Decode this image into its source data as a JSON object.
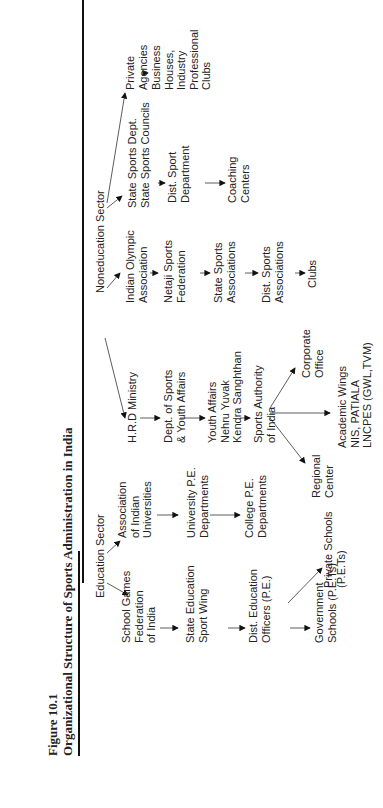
{
  "figure": {
    "number": "Figure 10.1",
    "title": "Organizational Structure of Sports Administration in India"
  },
  "sectors": {
    "education": "Education Sector",
    "noneducation": "Noneducation Sector"
  },
  "nodes": {
    "sgfi": "School Games\nFederation\nof India",
    "state_edu": "State Education\nSport Wing",
    "deo": "Dist. Education\nOfficers (P.E.)",
    "govt_schools": "Government\nSchools (P.E.Ts)",
    "private_schools": "Private Schools\n(P.E.Ts)",
    "aiu": "Association\nof Indian\nUniversities",
    "univ_pe": "University P.E.\nDepartments",
    "college_pe": "College P.E.\nDepartments",
    "hrd": "H.R.D Ministry",
    "dept_sports": "Dept. of Sports\n& Youth Affairs",
    "youth_affairs": "Youth Affairs\nNehru Yuvak\nKendra Sanghthan",
    "sai": "Sports Authority\nof India",
    "regional": "Regional\nCenter",
    "corporate": "Corporate\nOffice",
    "academic": "Academic Wings\nNIS, PATIALA\nLNCPES (GWL,TVM)",
    "ioa": "Indian Olympic\nAssociation",
    "netaji": "Netaji Sports\nFederation",
    "state_sports_assoc": "State Sports\nAssociations",
    "dist_sports_assoc": "Dist. Sports\nAssociations",
    "clubs": "Clubs",
    "state_sports_dept": "State Sports Dept.\nState Sports Councils",
    "dist_sport_dept": "Dist. Sport\nDepartment",
    "coaching": "Coaching\nCenters",
    "private_agencies": "Private\nAgencies",
    "business": "Business\nHouses,\nIndustry\nProfessional\nClubs"
  }
}
